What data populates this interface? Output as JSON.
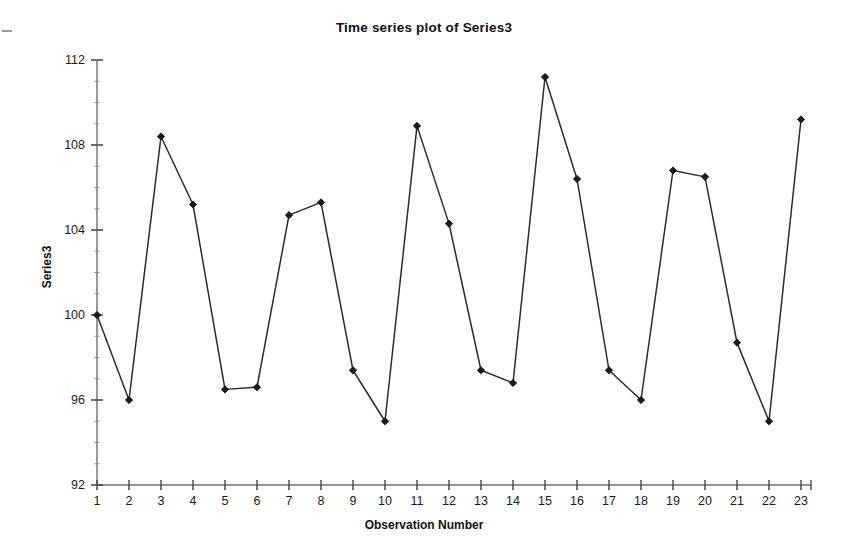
{
  "chart_data": {
    "type": "line",
    "title": "Time series plot of Series3",
    "xlabel": "Observation Number",
    "ylabel": "Series3",
    "x": [
      1,
      2,
      3,
      4,
      5,
      6,
      7,
      8,
      9,
      10,
      11,
      12,
      13,
      14,
      15,
      16,
      17,
      18,
      19,
      20,
      21,
      22,
      23
    ],
    "values": [
      100.0,
      96.0,
      108.4,
      105.2,
      96.5,
      96.6,
      104.7,
      105.3,
      97.4,
      95.0,
      108.9,
      104.3,
      97.4,
      96.8,
      111.2,
      106.4,
      97.4,
      96.0,
      106.8,
      106.5,
      98.7,
      95.0,
      109.2
    ],
    "series": [
      {
        "name": "Series3",
        "values": [
          100.0,
          96.0,
          108.4,
          105.2,
          96.5,
          96.6,
          104.7,
          105.3,
          97.4,
          95.0,
          108.9,
          104.3,
          97.4,
          96.8,
          111.2,
          106.4,
          97.4,
          96.0,
          106.8,
          106.5,
          98.7,
          95.0,
          109.2
        ]
      }
    ],
    "xlim": [
      1,
      23
    ],
    "ylim": [
      92,
      112
    ],
    "ytick_labels": [
      "92",
      "96",
      "100",
      "104",
      "108",
      "112"
    ],
    "yticks": [
      92,
      96,
      100,
      104,
      108,
      112
    ],
    "xtick_labels": [
      "1",
      "2",
      "3",
      "4",
      "5",
      "6",
      "7",
      "8",
      "9",
      "10",
      "11",
      "12",
      "13",
      "14",
      "15",
      "16",
      "17",
      "18",
      "19",
      "20",
      "21",
      "22",
      "23"
    ],
    "xticks": [
      1,
      2,
      3,
      4,
      5,
      6,
      7,
      8,
      9,
      10,
      11,
      12,
      13,
      14,
      15,
      16,
      17,
      18,
      19,
      20,
      21,
      22,
      23
    ],
    "grid": false,
    "legend": null,
    "marker": "diamond",
    "line_color": "#2b2b2b",
    "marker_color": "#1a1a1a",
    "background_color": "#ffffff"
  }
}
